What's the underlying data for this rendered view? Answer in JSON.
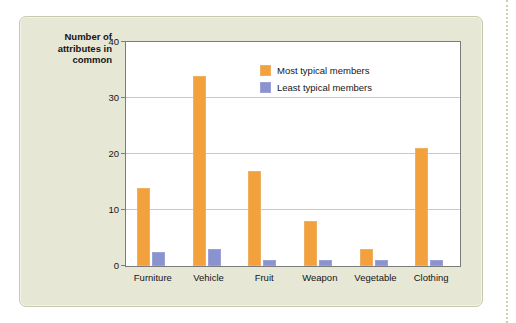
{
  "figure": {
    "panel_background": "#e7e7d6",
    "plot_background": "#ffffff",
    "border_color": "#c9c9ad"
  },
  "chart_data": {
    "type": "bar",
    "title": "",
    "xlabel": "",
    "ylabel": "Number of\nattributes in\ncommon",
    "ylim": [
      0,
      40
    ],
    "yticks": [
      0,
      10,
      20,
      30,
      40
    ],
    "ytick_labels": [
      "0",
      "10",
      "20",
      "30",
      "40"
    ],
    "grid": true,
    "grid_axis": "y",
    "legend_position": "upper right",
    "categories": [
      "Furniture",
      "Vehicle",
      "Fruit",
      "Weapon",
      "Vegetable",
      "Clothing"
    ],
    "series": [
      {
        "name": "Most typical members",
        "color": "#f2a13c",
        "values": [
          14,
          34,
          17,
          8,
          3,
          21
        ]
      },
      {
        "name": "Least typical members",
        "color": "#8a93d0",
        "values": [
          2.5,
          3,
          1,
          1,
          1,
          1
        ]
      }
    ]
  }
}
